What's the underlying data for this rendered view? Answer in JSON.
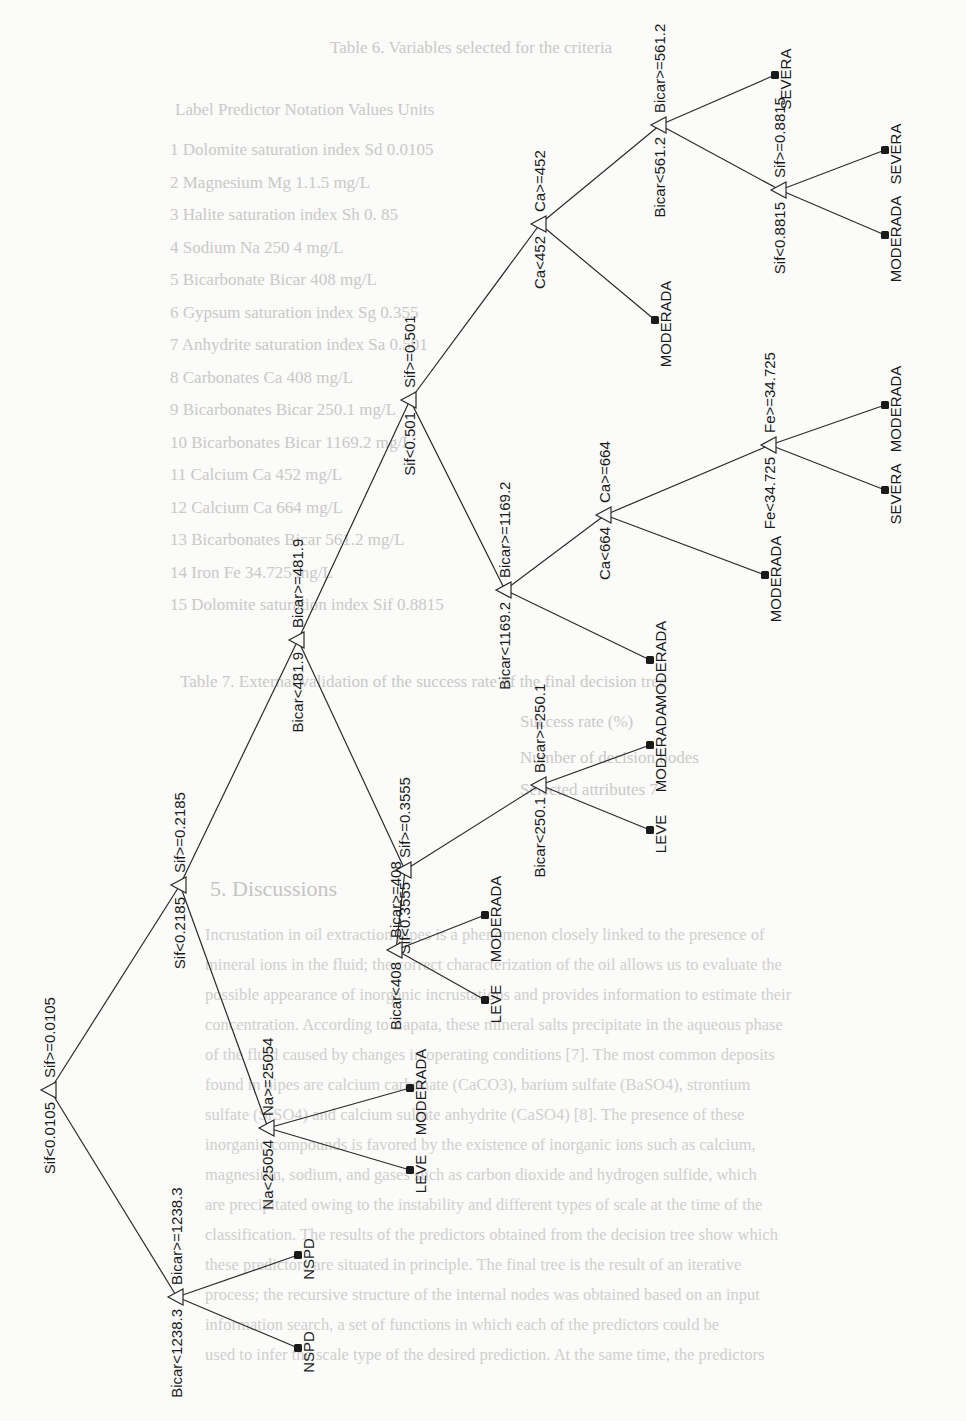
{
  "background_text": {
    "table6_caption": "Table 6. Variables selected for the criteria",
    "table6_header": "Label   Predictor           Notation   Values   Units",
    "table6_rows": [
      "1   Dolomite saturation index     Sd        0.0105",
      "2   Magnesium                     Mg        1.1.5  mg/L",
      "3   Halite saturation index       Sh        0.  85",
      "4   Sodium                        Na        250 4  mg/L",
      "5   Bicarbonate                   Bicar     408   mg/L",
      "6   Gypsum saturation index       Sg        0.355",
      "7   Anhydrite saturation index    Sa        0.501",
      "8   Carbonates                    Ca        408   mg/L",
      "9   Bicarbonates                  Bicar     250.1 mg/L",
      "10  Bicarbonates                  Bicar     1169.2 mg/L",
      "11  Calcium                       Ca        452   mg/L",
      "12  Calcium                       Ca        664   mg/L",
      "13  Bicarbonates                  Bicar     561.2 mg/L",
      "14  Iron                          Fe        34.725 mg/L",
      "15  Dolomite saturation index     Sif       0.8815"
    ],
    "table7_caption": "Table 7. External validation of the success rate of the final decision tree",
    "table7_rows": [
      "Success rate (%)",
      "Number of decision nodes",
      "Selected attributes  7"
    ],
    "section_heading": "5. Discussions",
    "paragraph_lines": [
      "Incrustation in oil extraction pipes is a phenomenon closely linked to the presence of",
      "mineral ions in the fluid; the correct characterization of the oil allows us to evaluate the",
      "possible appearance of inorganic incrustations and provides information to estimate their",
      "concentration. According to Zapata, these mineral salts precipitate in the aqueous phase",
      "of the fluid caused by changes in operating conditions [7]. The most common deposits",
      "found in pipes are calcium carbonate (CaCO3), barium sulfate (BaSO4), strontium",
      "sulfate (SrSO4) and calcium sulfate anhydrite (CaSO4) [8]. The presence of these",
      "inorganic compounds is favored by the existence of inorganic ions such as calcium,",
      "magnesium, sodium, and gases such as carbon dioxide and hydrogen sulfide, which",
      "are precipitated owing to the instability and different types of scale at the time of the",
      "classification. The results of the predictors obtained from the decision tree show which",
      "these predictors are situated in principle. The final tree is the result of an iterative",
      "process; the recursive structure of the internal nodes was obtained based on an input",
      "information search, a set of functions in which each of the predictors could be",
      "used to infer the scale type of the desired prediction. At the same time, the predictors"
    ]
  },
  "tree": {
    "nodes": [
      {
        "id": "root",
        "x": 50,
        "y": 1090,
        "left_label": "Sif<0.0105",
        "right_label": "Sif>=0.0105"
      },
      {
        "id": "n_bicar1238",
        "x": 177,
        "y": 1297,
        "left_label": "Bicar<1238.3",
        "right_label": "Bicar>=1238.3"
      },
      {
        "id": "n_sif2185",
        "x": 180,
        "y": 885,
        "left_label": "Sif<0.2185",
        "right_label": "Sif>=0.2185"
      },
      {
        "id": "n_na25054",
        "x": 268,
        "y": 1128,
        "left_label": "Na<25054",
        "right_label": "Na>=25054"
      },
      {
        "id": "n_bicar4819",
        "x": 298,
        "y": 640,
        "left_label": "Bicar<481.9",
        "right_label": "Bicar>=481.9"
      },
      {
        "id": "n_sif3555",
        "x": 405,
        "y": 870,
        "left_label": "Sif<0.3555",
        "right_label": "Sif>=0.3555"
      },
      {
        "id": "n_bicar408",
        "x": 396,
        "y": 950,
        "left_label": "Bicar<408",
        "right_label": "Bicar>=408"
      },
      {
        "id": "n_bicar2501",
        "x": 540,
        "y": 785,
        "left_label": "Bicar<250.1",
        "right_label": "Bicar>=250.1"
      },
      {
        "id": "n_sif501",
        "x": 410,
        "y": 400,
        "left_label": "Sif<0.501",
        "right_label": "Sif>=0.501"
      },
      {
        "id": "n_bicar11692",
        "x": 505,
        "y": 590,
        "left_label": "Bicar<1169.2",
        "right_label": "Bicar>=1169.2"
      },
      {
        "id": "n_ca664",
        "x": 605,
        "y": 515,
        "left_label": "Ca<664",
        "right_label": "Ca>=664"
      },
      {
        "id": "n_fe34725",
        "x": 770,
        "y": 445,
        "left_label": "Fe<34.725",
        "right_label": "Fe>=34.725"
      },
      {
        "id": "n_ca452",
        "x": 540,
        "y": 224,
        "left_label": "Ca<452",
        "right_label": "Ca>=452"
      },
      {
        "id": "n_bicar5612",
        "x": 660,
        "y": 125,
        "left_label": "Bicar<561.2",
        "right_label": "Bicar>=561.2"
      },
      {
        "id": "n_sif8815",
        "x": 780,
        "y": 190,
        "left_label": "Sif<0.8815",
        "right_label": "Sif>=0.8815"
      }
    ],
    "leaves": [
      {
        "id": "l1",
        "x": 298,
        "y": 1348,
        "label": "NSPD"
      },
      {
        "id": "l2",
        "x": 298,
        "y": 1255,
        "label": "NSPD"
      },
      {
        "id": "l3",
        "x": 410,
        "y": 1170,
        "label": "LEVE"
      },
      {
        "id": "l4",
        "x": 410,
        "y": 1088,
        "label": "MODERADA"
      },
      {
        "id": "l5",
        "x": 485,
        "y": 1000,
        "label": "LEVE"
      },
      {
        "id": "l6",
        "x": 485,
        "y": 915,
        "label": "MODERADA"
      },
      {
        "id": "l7",
        "x": 650,
        "y": 830,
        "label": "LEVE"
      },
      {
        "id": "l8",
        "x": 650,
        "y": 745,
        "label": "MODERADA"
      },
      {
        "id": "l9",
        "x": 650,
        "y": 660,
        "label": "MODERADA"
      },
      {
        "id": "l10",
        "x": 765,
        "y": 575,
        "label": "MODERADA"
      },
      {
        "id": "l11",
        "x": 885,
        "y": 490,
        "label": "SEVERA"
      },
      {
        "id": "l12",
        "x": 885,
        "y": 405,
        "label": "MODERADA"
      },
      {
        "id": "l13",
        "x": 655,
        "y": 320,
        "label": "MODERADA"
      },
      {
        "id": "l14",
        "x": 775,
        "y": 75,
        "label": "SEVERA"
      },
      {
        "id": "l15",
        "x": 885,
        "y": 235,
        "label": "MODERADA"
      },
      {
        "id": "l16",
        "x": 885,
        "y": 150,
        "label": "SEVERA"
      }
    ],
    "edges": [
      [
        "root",
        "n_bicar1238"
      ],
      [
        "root",
        "n_sif2185"
      ],
      [
        "n_bicar1238",
        "l1"
      ],
      [
        "n_bicar1238",
        "l2"
      ],
      [
        "n_sif2185",
        "n_na25054"
      ],
      [
        "n_sif2185",
        "n_bicar4819"
      ],
      [
        "n_na25054",
        "l3"
      ],
      [
        "n_na25054",
        "l4"
      ],
      [
        "n_bicar4819",
        "n_sif3555"
      ],
      [
        "n_bicar4819",
        "n_sif501"
      ],
      [
        "n_sif3555",
        "n_bicar408"
      ],
      [
        "n_sif3555",
        "n_bicar2501"
      ],
      [
        "n_bicar408",
        "l5"
      ],
      [
        "n_bicar408",
        "l6"
      ],
      [
        "n_bicar2501",
        "l7"
      ],
      [
        "n_bicar2501",
        "l8"
      ],
      [
        "n_sif501",
        "n_bicar11692"
      ],
      [
        "n_sif501",
        "n_ca452"
      ],
      [
        "n_bicar11692",
        "l9"
      ],
      [
        "n_bicar11692",
        "n_ca664"
      ],
      [
        "n_ca664",
        "l10"
      ],
      [
        "n_ca664",
        "n_fe34725"
      ],
      [
        "n_fe34725",
        "l11"
      ],
      [
        "n_fe34725",
        "l12"
      ],
      [
        "n_ca452",
        "l13"
      ],
      [
        "n_ca452",
        "n_bicar5612"
      ],
      [
        "n_bicar5612",
        "n_sif8815"
      ],
      [
        "n_bicar5612",
        "l14"
      ],
      [
        "n_sif8815",
        "l15"
      ],
      [
        "n_sif8815",
        "l16"
      ]
    ]
  }
}
